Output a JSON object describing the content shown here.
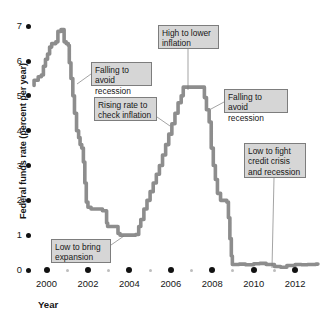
{
  "chart_data": {
    "type": "line",
    "title": "",
    "subtitle": "",
    "xlabel": "Year",
    "ylabel": "Federal funds rate (percent per year)",
    "xlim": [
      1999.3,
      2013.2
    ],
    "ylim": [
      0,
      7.35
    ],
    "grid": false,
    "legend": null,
    "line_color": "#8d8d8d",
    "xticks": [
      "2000",
      "2002",
      "2004",
      "2006",
      "2008",
      "2010",
      "2012"
    ],
    "xtick_values": [
      2000,
      2002,
      2004,
      2006,
      2008,
      2010,
      2012
    ],
    "xminor_values": [
      2001,
      2003,
      2005,
      2007,
      2009,
      2011
    ],
    "yticks": [
      "0",
      "1",
      "2",
      "3",
      "4",
      "5",
      "6",
      "7"
    ],
    "ytick_values": [
      0,
      1,
      2,
      3,
      4,
      5,
      6,
      7
    ],
    "series": [
      {
        "name": "Federal funds rate",
        "x": [
          1999.4,
          1999.6,
          1999.75,
          1999.85,
          1999.95,
          2000.05,
          2000.15,
          2000.25,
          2000.35,
          2000.45,
          2000.55,
          2000.7,
          2000.85,
          2000.95,
          2001.0,
          2001.05,
          2001.1,
          2001.18,
          2001.27,
          2001.35,
          2001.45,
          2001.55,
          2001.62,
          2001.7,
          2001.78,
          2001.85,
          2001.92,
          2002.0,
          2002.15,
          2002.4,
          2002.7,
          2002.9,
          2002.95,
          2003.1,
          2003.3,
          2003.45,
          2003.55,
          2003.7,
          2003.9,
          2004.1,
          2004.3,
          2004.45,
          2004.55,
          2004.7,
          2004.85,
          2005.0,
          2005.15,
          2005.3,
          2005.45,
          2005.6,
          2005.75,
          2005.9,
          2006.05,
          2006.2,
          2006.35,
          2006.5,
          2006.6,
          2006.8,
          2007.0,
          2007.25,
          2007.5,
          2007.62,
          2007.72,
          2007.85,
          2007.95,
          2008.05,
          2008.15,
          2008.25,
          2008.4,
          2008.55,
          2008.7,
          2008.78,
          2008.85,
          2008.92,
          2008.97,
          2009.05,
          2009.3,
          2009.6,
          2010.0,
          2010.3,
          2010.6,
          2011.0,
          2011.3,
          2011.6,
          2012.0,
          2012.3,
          2012.6,
          2013.0,
          2013.1
        ],
        "y": [
          5.3,
          5.45,
          5.55,
          5.6,
          5.85,
          6.05,
          6.2,
          6.4,
          6.5,
          6.5,
          6.55,
          6.85,
          6.9,
          6.55,
          6.5,
          6.5,
          6.45,
          5.95,
          5.5,
          5.0,
          4.5,
          4.0,
          3.8,
          3.6,
          3.5,
          3.1,
          2.5,
          1.95,
          1.8,
          1.75,
          1.75,
          1.7,
          1.35,
          1.25,
          1.25,
          1.25,
          1.05,
          1.0,
          1.0,
          1.0,
          1.0,
          1.02,
          1.25,
          1.45,
          1.75,
          2.0,
          2.25,
          2.5,
          2.75,
          3.0,
          3.3,
          3.6,
          3.9,
          4.2,
          4.5,
          4.8,
          5.0,
          5.25,
          5.25,
          5.25,
          5.25,
          5.25,
          4.95,
          4.6,
          4.25,
          3.5,
          3.0,
          2.6,
          2.2,
          2.0,
          2.0,
          1.95,
          1.5,
          0.9,
          0.4,
          0.16,
          0.16,
          0.17,
          0.15,
          0.18,
          0.19,
          0.16,
          0.1,
          0.08,
          0.13,
          0.16,
          0.15,
          0.16,
          0.17
        ]
      }
    ],
    "annotations": [
      {
        "id": "falling-to-avoid-recession-1",
        "text": "Falling to avoid\nrecession",
        "box_x": 91,
        "box_y": 62,
        "box_w": 61,
        "box_h": 24,
        "leader_from_x": 91,
        "leader_from_y": 74,
        "leader_to_x": 77,
        "leader_to_y": 84
      },
      {
        "id": "rising-rate-to-check-inflation",
        "text": "Rising rate to\ncheck inflation",
        "box_x": 94,
        "box_y": 97,
        "box_w": 63,
        "box_h": 24,
        "leader_from_x": 157,
        "leader_from_y": 117,
        "leader_to_x": 170,
        "leader_to_y": 126
      },
      {
        "id": "high-to-lower-inflation",
        "text": "High to lower\ninflation",
        "box_x": 158,
        "box_y": 25,
        "box_w": 61,
        "box_h": 24,
        "leader_from_x": 188,
        "leader_from_y": 49,
        "leader_to_x": 188,
        "leader_to_y": 90
      },
      {
        "id": "falling-to-avoid-recession-2",
        "text": "Falling to avoid\nrecession",
        "box_x": 224,
        "box_y": 89,
        "box_w": 64,
        "box_h": 24,
        "leader_from_x": 224,
        "leader_from_y": 102,
        "leader_to_x": 211,
        "leader_to_y": 109
      },
      {
        "id": "low-to-fight-credit-crisis",
        "text": "Low to fight\ncredit crisis\nand recession",
        "box_x": 244,
        "box_y": 143,
        "box_w": 62,
        "box_h": 35,
        "leader_from_x": 274,
        "leader_from_y": 178,
        "leader_to_x": 272,
        "leader_to_y": 268
      },
      {
        "id": "low-to-bring-expansion",
        "text": "Low to bring\nexpansion",
        "box_x": 51,
        "box_y": 239,
        "box_w": 60,
        "box_h": 24,
        "leader_from_x": 111,
        "leader_from_y": 245,
        "leader_to_x": 124,
        "leader_to_y": 236
      }
    ]
  }
}
